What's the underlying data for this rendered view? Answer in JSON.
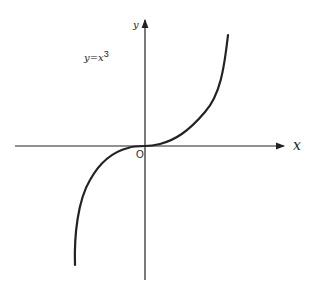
{
  "diagram": {
    "equation_label": "y=x",
    "equation_exponent": "3",
    "x_axis_label": "x",
    "y_axis_label": "y",
    "origin_label": "O",
    "stroke_color": "#222222",
    "curve": "y = x^3"
  }
}
